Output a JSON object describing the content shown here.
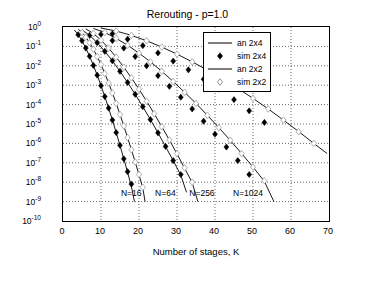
{
  "chart_data": {
    "type": "line",
    "title": "Rerouting - p=1.0",
    "xlabel": "Number of stages, K",
    "ylabel": "Network cell loss probability, π",
    "ylabel_sub": "n",
    "xlim": [
      0,
      70
    ],
    "ylim": [
      1e-10,
      1
    ],
    "xticks": [
      "0",
      "10",
      "20",
      "30",
      "40",
      "50",
      "60",
      "70"
    ],
    "yticks": [
      "10^0",
      "10^-1",
      "10^-2",
      "10^-3",
      "10^-4",
      "10^-5",
      "10^-6",
      "10^-7",
      "10^-8",
      "10^-9",
      "10^-10"
    ],
    "ytick_labels": [
      {
        "mant": "10",
        "exp": "0"
      },
      {
        "mant": "10",
        "exp": "-1"
      },
      {
        "mant": "10",
        "exp": "-2"
      },
      {
        "mant": "10",
        "exp": "-3"
      },
      {
        "mant": "10",
        "exp": "-4"
      },
      {
        "mant": "10",
        "exp": "-5"
      },
      {
        "mant": "10",
        "exp": "-6"
      },
      {
        "mant": "10",
        "exp": "-7"
      },
      {
        "mant": "10",
        "exp": "-8"
      },
      {
        "mant": "10",
        "exp": "-9"
      },
      {
        "mant": "10",
        "exp": "-10"
      }
    ],
    "grid": true,
    "legend_position": "top-right",
    "legend": [
      {
        "label": "an 2x4",
        "style": "line",
        "marker": "none",
        "color": "#000000"
      },
      {
        "label": "sim 2x4",
        "style": "none",
        "marker": "filled-diamond",
        "color": "#000000"
      },
      {
        "label": "an 2x2",
        "style": "line",
        "marker": "none",
        "color": "#000000"
      },
      {
        "label": "sim 2x2",
        "style": "none",
        "marker": "open-diamond",
        "color": "#888888"
      }
    ],
    "annotations": [
      {
        "text": "N=16",
        "x": 15.5,
        "y": 2.2e-09
      },
      {
        "text": "N=64",
        "x": 24.5,
        "y": 2.2e-09
      },
      {
        "text": "N=256",
        "x": 33.5,
        "y": 2.2e-09
      },
      {
        "text": "N=1024",
        "x": 45.0,
        "y": 2.2e-09
      }
    ],
    "series": [
      {
        "name": "an 2x2 N=16",
        "type": "line",
        "color": "#000000",
        "points": [
          [
            4,
            0.78
          ],
          [
            5,
            0.52
          ],
          [
            6,
            0.3
          ],
          [
            7,
            0.155
          ],
          [
            8,
            0.072
          ],
          [
            9,
            0.03
          ],
          [
            10,
            0.0115
          ],
          [
            11,
            0.004
          ],
          [
            12,
            0.0013
          ],
          [
            13,
            0.0004
          ],
          [
            14,
            0.000115
          ],
          [
            15,
            3.1e-05
          ],
          [
            16,
            8e-06
          ],
          [
            17,
            2e-06
          ],
          [
            18,
            4.7e-07
          ],
          [
            19,
            1.1e-07
          ],
          [
            20,
            2.4e-08
          ],
          [
            21,
            5e-09
          ],
          [
            21.6,
            1e-09
          ]
        ]
      },
      {
        "name": "an 2x2 N=64",
        "type": "line",
        "color": "#000000",
        "points": [
          [
            6,
            0.8
          ],
          [
            8,
            0.46
          ],
          [
            10,
            0.21
          ],
          [
            12,
            0.082
          ],
          [
            14,
            0.028
          ],
          [
            16,
            0.0085
          ],
          [
            18,
            0.0024
          ],
          [
            20,
            0.00062
          ],
          [
            22,
            0.00015
          ],
          [
            24,
            3.4e-05
          ],
          [
            26,
            7.3e-06
          ],
          [
            28,
            1.5e-06
          ],
          [
            30,
            2.9e-07
          ],
          [
            32,
            5.3e-08
          ],
          [
            34,
            9.3e-09
          ],
          [
            35.5,
            1e-09
          ]
        ]
      },
      {
        "name": "an 2x2 N=256",
        "type": "line",
        "color": "#000000",
        "points": [
          [
            8,
            0.84
          ],
          [
            11,
            0.52
          ],
          [
            14,
            0.26
          ],
          [
            17,
            0.115
          ],
          [
            20,
            0.045
          ],
          [
            23,
            0.016
          ],
          [
            26,
            0.0052
          ],
          [
            29,
            0.00155
          ],
          [
            32,
            0.00043
          ],
          [
            35,
            0.000115
          ],
          [
            38,
            2.8e-05
          ],
          [
            41,
            6.5e-06
          ],
          [
            44,
            1.45e-06
          ],
          [
            47,
            3e-07
          ],
          [
            50,
            6e-08
          ],
          [
            53,
            1.1e-08
          ],
          [
            55.5,
            1e-09
          ]
        ]
      },
      {
        "name": "an 2x2 N=1024",
        "type": "line",
        "color": "#000000",
        "points": [
          [
            10,
            0.88
          ],
          [
            14,
            0.62
          ],
          [
            18,
            0.37
          ],
          [
            22,
            0.195
          ],
          [
            26,
            0.092
          ],
          [
            30,
            0.04
          ],
          [
            34,
            0.016
          ],
          [
            38,
            0.006
          ],
          [
            42,
            0.0021
          ],
          [
            46,
            0.00068
          ],
          [
            50,
            0.00021
          ],
          [
            54,
            6e-05
          ],
          [
            58,
            1.6e-05
          ],
          [
            62,
            4.1e-06
          ],
          [
            66,
            1e-06
          ],
          [
            69.5,
            3e-07
          ]
        ]
      },
      {
        "name": "an 2x4 N=16",
        "type": "line",
        "color": "#000000",
        "points": [
          [
            3,
            0.7
          ],
          [
            4,
            0.4
          ],
          [
            5,
            0.195
          ],
          [
            6,
            0.082
          ],
          [
            7,
            0.031
          ],
          [
            8,
            0.0105
          ],
          [
            9,
            0.0033
          ],
          [
            10,
            0.00095
          ],
          [
            11,
            0.00026
          ],
          [
            12,
            6.6e-05
          ],
          [
            13,
            1.6e-05
          ],
          [
            14,
            3.6e-06
          ],
          [
            15,
            7.8e-07
          ],
          [
            16,
            1.6e-07
          ],
          [
            17,
            3.2e-08
          ],
          [
            18,
            6e-09
          ],
          [
            18.8,
            1e-09
          ]
        ]
      },
      {
        "name": "an 2x4 N=64",
        "type": "line",
        "color": "#000000",
        "points": [
          [
            5,
            0.72
          ],
          [
            7,
            0.37
          ],
          [
            9,
            0.155
          ],
          [
            11,
            0.056
          ],
          [
            13,
            0.018
          ],
          [
            15,
            0.0052
          ],
          [
            17,
            0.00138
          ],
          [
            19,
            0.00034
          ],
          [
            21,
            7.8e-05
          ],
          [
            23,
            1.7e-05
          ],
          [
            25,
            3.5e-06
          ],
          [
            27,
            6.8e-07
          ],
          [
            29,
            1.3e-07
          ],
          [
            31,
            2.3e-08
          ],
          [
            32.5,
            3e-09
          ]
        ]
      },
      {
        "name": "sim 2x4 N=16",
        "type": "scatter",
        "marker": "filled-diamond",
        "color": "#000000",
        "points": [
          [
            4,
            0.4
          ],
          [
            5,
            0.195
          ],
          [
            6,
            0.082
          ],
          [
            7,
            0.031
          ],
          [
            8,
            0.0105
          ],
          [
            9,
            0.0033
          ],
          [
            10,
            0.00095
          ],
          [
            11,
            0.00026
          ],
          [
            12,
            6.6e-05
          ],
          [
            13,
            1.6e-05
          ],
          [
            14,
            3.6e-06
          ],
          [
            15,
            8e-07
          ],
          [
            16,
            1.6e-07
          ],
          [
            17,
            3.5e-08
          ],
          [
            18,
            8e-09
          ]
        ]
      },
      {
        "name": "sim 2x4 N=64",
        "type": "scatter",
        "marker": "filled-diamond",
        "color": "#000000",
        "points": [
          [
            7,
            0.37
          ],
          [
            9,
            0.155
          ],
          [
            11,
            0.056
          ],
          [
            13,
            0.018
          ],
          [
            15,
            0.0052
          ],
          [
            17,
            0.00138
          ],
          [
            19,
            0.00034
          ],
          [
            21,
            7.8e-05
          ],
          [
            23,
            1.7e-05
          ],
          [
            25,
            3.5e-06
          ],
          [
            27,
            7e-07
          ],
          [
            29,
            1.3e-07
          ],
          [
            31,
            2.5e-08
          ]
        ]
      },
      {
        "name": "sim 2x4 N=256",
        "type": "scatter",
        "marker": "filled-diamond",
        "color": "#000000",
        "points": [
          [
            10,
            0.42
          ],
          [
            13,
            0.2
          ],
          [
            16,
            0.082
          ],
          [
            19,
            0.03
          ],
          [
            22,
            0.01
          ],
          [
            25,
            0.0031
          ],
          [
            28,
            0.00088
          ],
          [
            31,
            0.00024
          ],
          [
            34,
            6e-05
          ],
          [
            37,
            1.4e-05
          ],
          [
            40,
            3e-06
          ],
          [
            43,
            6.5e-07
          ],
          [
            46,
            1.3e-07
          ],
          [
            49,
            2.5e-08
          ]
        ]
      },
      {
        "name": "sim 2x4 N=1024",
        "type": "scatter",
        "marker": "filled-diamond",
        "color": "#000000",
        "points": [
          [
            13,
            0.45
          ],
          [
            17,
            0.235
          ],
          [
            21,
            0.11
          ],
          [
            25,
            0.046
          ],
          [
            29,
            0.0175
          ],
          [
            33,
            0.0062
          ],
          [
            37,
            0.00205
          ],
          [
            41,
            0.00063
          ],
          [
            45,
            0.00018
          ],
          [
            49,
            4.8e-05
          ],
          [
            53,
            1.2e-05
          ]
        ]
      },
      {
        "name": "sim 2x2 N=16",
        "type": "scatter",
        "marker": "open-diamond",
        "color": "#9a9a9a",
        "points": [
          [
            5,
            0.52
          ],
          [
            6,
            0.3
          ],
          [
            7,
            0.155
          ],
          [
            8,
            0.072
          ],
          [
            9,
            0.03
          ],
          [
            10,
            0.0115
          ],
          [
            11,
            0.004
          ],
          [
            12,
            0.0013
          ],
          [
            13,
            0.0004
          ],
          [
            14,
            0.000115
          ],
          [
            15,
            3.1e-05
          ],
          [
            16,
            8e-06
          ],
          [
            17,
            2e-06
          ],
          [
            18,
            4.7e-07
          ],
          [
            19,
            1.1e-07
          ],
          [
            20,
            2.5e-08
          ],
          [
            21,
            5.5e-09
          ]
        ]
      },
      {
        "name": "sim 2x2 N=64",
        "type": "scatter",
        "marker": "open-diamond",
        "color": "#9a9a9a",
        "points": [
          [
            8,
            0.46
          ],
          [
            10,
            0.21
          ],
          [
            12,
            0.082
          ],
          [
            14,
            0.028
          ],
          [
            16,
            0.0085
          ],
          [
            18,
            0.0024
          ],
          [
            20,
            0.00062
          ],
          [
            22,
            0.00015
          ],
          [
            24,
            3.4e-05
          ],
          [
            26,
            7.3e-06
          ],
          [
            28,
            1.5e-06
          ],
          [
            30,
            3e-07
          ],
          [
            32,
            5.5e-08
          ],
          [
            34,
            1e-08
          ]
        ]
      },
      {
        "name": "sim 2x2 N=256",
        "type": "scatter",
        "marker": "open-diamond",
        "color": "#9a9a9a",
        "points": [
          [
            11,
            0.52
          ],
          [
            14,
            0.26
          ],
          [
            17,
            0.115
          ],
          [
            20,
            0.045
          ],
          [
            23,
            0.016
          ],
          [
            26,
            0.0052
          ],
          [
            29,
            0.00155
          ],
          [
            32,
            0.00043
          ],
          [
            35,
            0.000115
          ],
          [
            38,
            2.8e-05
          ],
          [
            41,
            6.5e-06
          ],
          [
            44,
            1.45e-06
          ],
          [
            47,
            3e-07
          ],
          [
            50,
            6e-08
          ],
          [
            53,
            1.2e-08
          ]
        ]
      },
      {
        "name": "sim 2x2 N=1024",
        "type": "scatter",
        "marker": "open-diamond",
        "color": "#9a9a9a",
        "points": [
          [
            14,
            0.62
          ],
          [
            18,
            0.37
          ],
          [
            22,
            0.195
          ],
          [
            26,
            0.092
          ],
          [
            30,
            0.04
          ],
          [
            34,
            0.016
          ],
          [
            38,
            0.006
          ],
          [
            42,
            0.0021
          ],
          [
            46,
            0.00068
          ],
          [
            50,
            0.00021
          ],
          [
            54,
            6e-05
          ],
          [
            58,
            1.6e-05
          ],
          [
            62,
            4e-06
          ],
          [
            66,
            1e-06
          ]
        ]
      }
    ]
  }
}
